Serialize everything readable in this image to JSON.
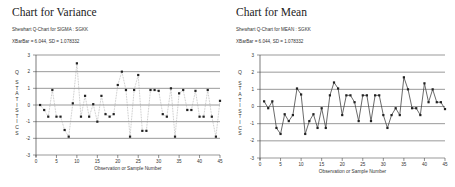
{
  "chart_data": [
    {
      "type": "line",
      "title": "Chart for Variance",
      "subtitle": "Shewhart Q-Chart for SIGMA : SGKK",
      "stats_line": "XBarBar = 6.044, SD = 1.078332",
      "xlabel": "Observation or Sample Number",
      "ylabel": "Q STATISTICS",
      "xlim": [
        0,
        45
      ],
      "ylim": [
        -3,
        3
      ],
      "xticks": [
        0,
        5,
        10,
        15,
        20,
        25,
        30,
        35,
        40,
        45
      ],
      "yticks": [
        -3,
        -2,
        -1,
        0,
        1,
        2,
        3
      ],
      "grid": "horizontal",
      "line_style": "dotted",
      "x": [
        1,
        2,
        3,
        4,
        5,
        6,
        7,
        8,
        9,
        10,
        11,
        12,
        13,
        14,
        15,
        16,
        17,
        18,
        19,
        20,
        21,
        22,
        23,
        24,
        25,
        26,
        27,
        28,
        29,
        30,
        31,
        32,
        33,
        34,
        35,
        36,
        37,
        38,
        39,
        40,
        41,
        42,
        43,
        44,
        45
      ],
      "values": [
        0.0,
        -0.3,
        -0.7,
        0.9,
        -0.7,
        -0.7,
        -1.5,
        -1.9,
        0.1,
        2.5,
        -0.7,
        0.55,
        -0.7,
        0.05,
        -1.0,
        0.55,
        -0.55,
        -0.7,
        -0.55,
        1.2,
        2.0,
        0.9,
        -1.9,
        0.9,
        1.8,
        -1.55,
        -1.55,
        0.9,
        0.9,
        0.85,
        -0.55,
        -0.7,
        1.0,
        -1.9,
        0.7,
        0.9,
        -0.3,
        -0.3,
        0.85,
        -0.7,
        -0.7,
        0.9,
        -0.7,
        -1.9,
        0.25
      ]
    },
    {
      "type": "line",
      "title": "Chart for Mean",
      "subtitle": "Shewhart Q-Chart for MEAN : SGKK",
      "stats_line": "XBarBar = 6.044, SD = 1.078332",
      "xlabel": "Observation or Sample Number",
      "ylabel": "Q STATISTICS",
      "xlim": [
        0,
        45
      ],
      "ylim": [
        -3,
        3
      ],
      "xticks": [
        0,
        5,
        10,
        15,
        20,
        25,
        30,
        35,
        40,
        45
      ],
      "yticks": [
        -3,
        -2,
        -1,
        0,
        1,
        2,
        3
      ],
      "grid": "horizontal",
      "line_style": "solid",
      "x": [
        1,
        2,
        3,
        4,
        5,
        6,
        7,
        8,
        9,
        10,
        11,
        12,
        13,
        14,
        15,
        16,
        17,
        18,
        19,
        20,
        21,
        22,
        23,
        24,
        25,
        26,
        27,
        28,
        29,
        30,
        31,
        32,
        33,
        34,
        35,
        36,
        37,
        38,
        39,
        40,
        41,
        42,
        43,
        44,
        45
      ],
      "values": [
        0.3,
        -0.1,
        0.3,
        -1.25,
        -1.6,
        -0.45,
        -0.85,
        -0.5,
        1.05,
        0.7,
        -1.6,
        -0.85,
        -0.45,
        -1.25,
        -0.1,
        -1.25,
        0.65,
        1.4,
        1.05,
        -0.5,
        0.65,
        0.65,
        0.25,
        -0.85,
        0.65,
        0.65,
        -0.85,
        0.65,
        0.65,
        -0.5,
        -1.25,
        -0.5,
        -0.1,
        -0.5,
        1.7,
        1.0,
        -0.1,
        -0.1,
        -0.5,
        1.35,
        0.25,
        1.0,
        0.25,
        0.25,
        -0.15
      ]
    }
  ]
}
